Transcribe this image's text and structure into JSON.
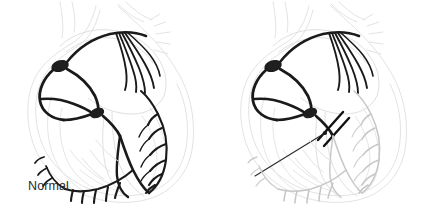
{
  "figure": {
    "type": "medical-illustration",
    "width": 427,
    "height": 218,
    "background_color": "#ffffff",
    "panel_count": 2
  },
  "panels": [
    {
      "id": "normal",
      "caption": "Normal",
      "caption_color": "#2b2b2b",
      "description": "Heart cross-section with intact conduction pathway",
      "conduction_color": "#1a1a1a",
      "outline_color": "#d8d8d8",
      "purkinje_state": "conducting",
      "has_block_marker": false
    },
    {
      "id": "block",
      "caption": "Block",
      "caption_color": "#2b2b2b",
      "description": "Heart cross-section with interrupted bundle branch conduction",
      "conduction_color": "#1a1a1a",
      "outline_color": "#d8d8d8",
      "purkinje_state": "non-conducting",
      "has_block_marker": true,
      "block_marker": {
        "label": "Block",
        "marker_type": "double-slash",
        "leader_line": true
      }
    }
  ],
  "anatomy": {
    "sa_node": "sinoatrial-node",
    "av_node": "atrioventricular-node",
    "bundle_of_his": "bundle-of-his",
    "bundle_branches": "bundle-branches",
    "purkinje_fibers": "purkinje-fibers",
    "internodal_pathways": "internodal-pathways",
    "atrial_fibers": "atrial-conduction-fibers"
  },
  "colors": {
    "conduction_dark": "#1a1a1a",
    "conduction_faint": "#c9c9c9",
    "heart_outline": "#dcdcdc",
    "heart_outline_soft": "#e6e6e6",
    "caption_text": "#2b2b2b",
    "background": "#ffffff"
  }
}
